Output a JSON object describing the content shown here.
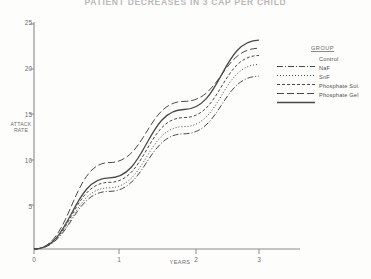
{
  "title": "PATIENT DECREASES IN 3 CAP PER CHILD",
  "axes": {
    "y_label_line1": "ATTACK",
    "y_label_line2": "RATE",
    "x_label": "YEARS",
    "y_ticks": [
      "5",
      "10",
      "15",
      "20",
      "25"
    ],
    "x_ticks": [
      "0",
      "1",
      "2",
      "3"
    ]
  },
  "legend": {
    "title": "GROUP",
    "items": [
      {
        "label": "Control",
        "style": "dash-dot"
      },
      {
        "label": "NaF",
        "style": "dotted"
      },
      {
        "label": "SnF",
        "style": "dashed"
      },
      {
        "label": "Phosphate Sol.",
        "style": "long-dash"
      },
      {
        "label": "Phosphate Gel",
        "style": "solid"
      }
    ]
  },
  "colors": {
    "ink": "#4a4a4a",
    "axis": "#7a7a7a",
    "faded": "#b9b9b9",
    "background": "#fdfdfc"
  },
  "chart_data": {
    "type": "line",
    "title": "PATIENT DECREASES IN 3 CAP PER CHILD",
    "xlabel": "YEARS",
    "ylabel": "ATTACK RATE",
    "xlim": [
      0,
      3.2
    ],
    "ylim": [
      0,
      26
    ],
    "grid": false,
    "legend_position": "right",
    "x": [
      0,
      1,
      2,
      3
    ],
    "series": [
      {
        "name": "Control",
        "values": [
          0,
          6.4,
          12.8,
          19.2
        ],
        "dash": "dash-dot"
      },
      {
        "name": "NaF",
        "values": [
          0,
          6.8,
          13.6,
          20.5
        ],
        "dash": "dotted"
      },
      {
        "name": "SnF",
        "values": [
          0,
          7.4,
          14.6,
          21.5
        ],
        "dash": "dashed"
      },
      {
        "name": "Phosphate Sol.",
        "values": [
          0,
          9.6,
          16.4,
          22.3
        ],
        "dash": "long-dash"
      },
      {
        "name": "Phosphate Gel",
        "values": [
          0,
          7.9,
          15.5,
          23.2
        ],
        "dash": "solid"
      }
    ]
  }
}
